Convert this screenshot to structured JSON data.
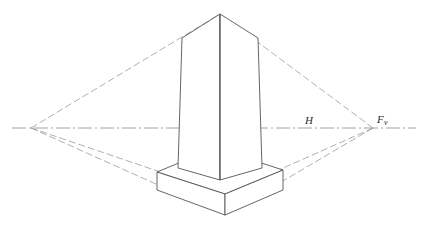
{
  "figure": {
    "background_color": "#ffffff",
    "line_color": "#555555",
    "construction_line_color": "#8a8a8a",
    "horizon_line_color": "#8a8a8a",
    "label_color": "#2b2b2b",
    "width": 426,
    "height": 240
  },
  "labels": {
    "horizon": "H",
    "vanishing_point_right": "F",
    "vanishing_point_right_sub": "v"
  },
  "geometry": {
    "horizon": {
      "y": 128,
      "x_start": 12,
      "x_end": 416
    },
    "vanishing_point_left": {
      "x": 31,
      "y": 128
    },
    "vanishing_point_right": {
      "x": 373,
      "y": 128
    },
    "tower": {
      "apex": {
        "x": 220,
        "y": 14
      },
      "top_left": {
        "x": 182,
        "y": 38
      },
      "top_right": {
        "x": 258,
        "y": 38
      },
      "bottom_left": {
        "x": 178,
        "y": 168
      },
      "bottom_center": {
        "x": 220,
        "y": 180
      },
      "bottom_right": {
        "x": 262,
        "y": 168
      }
    },
    "base": {
      "top_back_left": {
        "x": 157,
        "y": 172
      },
      "top_front": {
        "x": 225,
        "y": 194
      },
      "top_back_right": {
        "x": 283,
        "y": 170
      },
      "bottom_left": {
        "x": 157,
        "y": 190
      },
      "bottom_front": {
        "x": 225,
        "y": 215
      },
      "bottom_right": {
        "x": 283,
        "y": 190
      }
    }
  },
  "label_positions": {
    "horizon_label": {
      "x": 309,
      "y": 124
    },
    "vanishing_point_label": {
      "x": 377,
      "y": 123
    },
    "vanishing_point_sub": {
      "x": 384,
      "y": 125
    }
  }
}
